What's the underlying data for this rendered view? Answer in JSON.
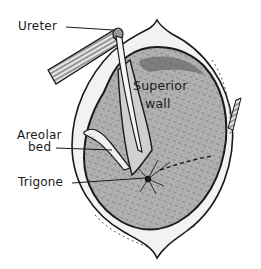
{
  "figure": {
    "colors": {
      "ink": "#1a1a1a",
      "mucosa_fill": "#b4b4b4",
      "wall_fill": "#f2f2f2",
      "background": "#ffffff"
    },
    "labels": {
      "ureter": "Ureter",
      "superior_wall_line1": "Superior",
      "superior_wall_line2": "wall",
      "areolar_bed_line1": "Areolar",
      "areolar_bed_line2": "bed",
      "trigone": "Trigone"
    }
  }
}
